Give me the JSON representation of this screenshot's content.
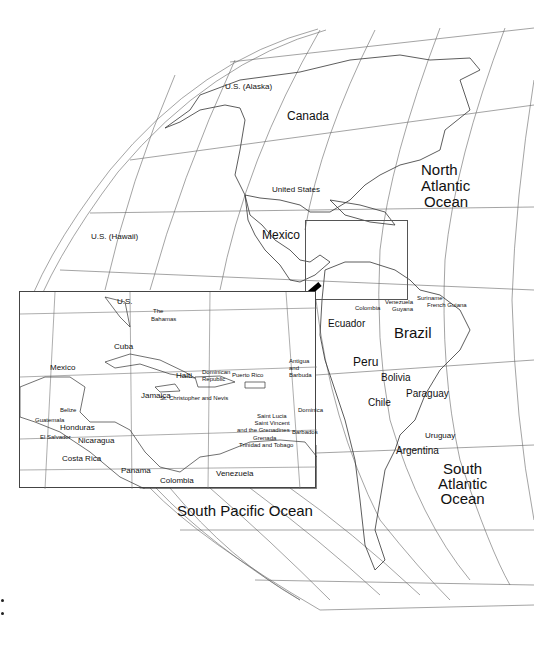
{
  "map": {
    "title": "Americas and Caribbean reference map",
    "main_labels": {
      "alaska": "U.S. (Alaska)",
      "canada": "Canada",
      "united_states": "United States",
      "north_atlantic": [
        "North",
        "Atlantic",
        "Ocean"
      ],
      "hawaii": "U.S. (Hawaii)",
      "mexico": "Mexico",
      "colombia": "Colombia",
      "venezuela": "Venezuela",
      "guyana": "Guyana",
      "suriname": "Suriname",
      "french_guiana": "French Guiana",
      "ecuador": "Ecuador",
      "brazil": "Brazil",
      "peru": "Peru",
      "bolivia": "Bolivia",
      "paraguay": "Paraguay",
      "chile": "Chile",
      "uruguay": "Uruguay",
      "argentina": "Argentina",
      "south_atlantic": [
        "South",
        "Atlantic",
        "Ocean"
      ],
      "south_pacific": "South Pacific Ocean"
    },
    "inset": {
      "labels": {
        "us": "U.S.",
        "bahamas": [
          "The",
          "Bahamas"
        ],
        "cuba": "Cuba",
        "mexico": "Mexico",
        "haiti": "Haiti",
        "dominican_republic": [
          "Dominican",
          "Republic"
        ],
        "puerto_rico": "Puerto Rico",
        "antigua": [
          "Antigua",
          "and",
          "Barbuda"
        ],
        "st_kitts": "St. Christopher and Nevis",
        "dominica": "Dominica",
        "jamaica": "Jamaica",
        "belize": "Belize",
        "guatemala": "Guatemala",
        "honduras": "Honduras",
        "el_salvador": "El Salvador",
        "nicaragua": "Nicaragua",
        "saint_lucia": "Saint Lucia",
        "saint_vincent": [
          "Saint Vincent",
          "and the Grenadines"
        ],
        "barbados": "Barbados",
        "grenada": "Grenada",
        "trinidad": "Trinidad and Tobago",
        "costa_rica": "Costa Rica",
        "panama": "Panama",
        "colombia": "Colombia",
        "venezuela": "Venezuela"
      }
    },
    "colors": {
      "line": "#555555",
      "coast": "#333333",
      "arrow": "#000000",
      "background": "#ffffff"
    }
  }
}
